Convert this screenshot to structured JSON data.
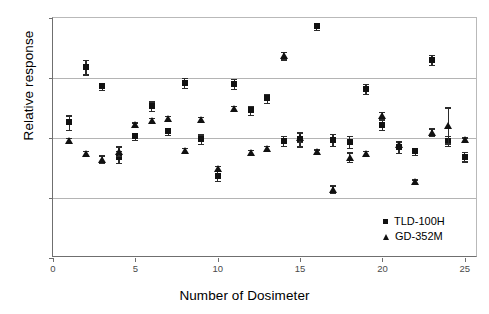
{
  "chart_data": {
    "type": "scatter",
    "title": "",
    "xlabel": "Number of Dosimeter",
    "ylabel": "Relative response",
    "xlim": [
      0,
      25.8
    ],
    "ylim": [
      0.8,
      1.2
    ],
    "xticks": [
      "0",
      "5",
      "10",
      "15",
      "20",
      "25"
    ],
    "xtick_values": [
      0,
      5,
      10,
      15,
      20,
      25
    ],
    "yticks": [
      "0,8",
      "0,9",
      "1",
      "1,1",
      "1,2"
    ],
    "ytick_values": [
      0.8,
      0.9,
      1.0,
      1.1,
      1.2
    ],
    "grid": "horizontal",
    "legend_position": "inside-lower-right",
    "x": [
      1,
      2,
      3,
      4,
      5,
      6,
      7,
      8,
      9,
      10,
      11,
      12,
      13,
      14,
      15,
      16,
      17,
      18,
      19,
      20,
      21,
      22,
      23,
      24,
      25
    ],
    "series": [
      {
        "name": "TLD-100H",
        "marker": "square",
        "color": "#111111",
        "values": [
          1.026,
          1.118,
          1.086,
          0.969,
          1.003,
          1.053,
          1.011,
          1.092,
          0.998,
          0.937,
          1.09,
          1.046,
          1.066,
          0.995,
          0.998,
          1.186,
          0.997,
          0.993,
          1.082,
          1.022,
          0.985,
          0.978,
          1.13,
          0.995,
          0.969
        ],
        "errors": [
          0.012,
          0.012,
          0.006,
          0.01,
          0.006,
          0.008,
          0.006,
          0.008,
          0.008,
          0.008,
          0.008,
          0.008,
          0.008,
          0.008,
          0.012,
          0.006,
          0.01,
          0.01,
          0.008,
          0.008,
          0.01,
          0.006,
          0.008,
          0.008,
          0.008
        ]
      },
      {
        "name": "GD-352M",
        "marker": "triangle",
        "color": "#111111",
        "values": [
          0.996,
          0.974,
          0.965,
          0.978,
          1.022,
          1.03,
          1.033,
          0.98,
          1.031,
          0.949,
          1.049,
          0.976,
          0.983,
          1.137,
          1.001,
          0.977,
          0.915,
          0.968,
          0.974,
          1.037,
          0.989,
          0.927,
          1.01,
          1.021,
          0.997
        ],
        "errors": [
          0.004,
          0.004,
          0.006,
          0.008,
          0.004,
          0.004,
          0.004,
          0.004,
          0.004,
          0.004,
          0.004,
          0.004,
          0.004,
          0.006,
          0.008,
          0.004,
          0.006,
          0.008,
          0.004,
          0.006,
          0.004,
          0.004,
          0.006,
          0.03,
          0.004
        ]
      }
    ]
  },
  "legend": {
    "entries": [
      {
        "label": "TLD-100H"
      },
      {
        "label": "GD-352M"
      }
    ]
  }
}
